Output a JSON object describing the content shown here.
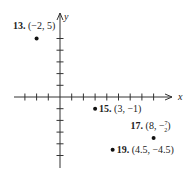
{
  "chart_data": {
    "type": "scatter",
    "title": "",
    "xlabel": "x",
    "ylabel": "y",
    "xlim": [
      -4,
      8
    ],
    "ylim": [
      -5,
      5
    ],
    "grid": false,
    "x_ticks": [
      -3,
      -2,
      -1,
      1,
      2,
      3,
      4,
      5,
      6,
      7,
      8
    ],
    "y_ticks": [
      -5,
      -4,
      -3,
      -2,
      -1,
      1,
      2,
      3,
      4,
      5
    ],
    "points": [
      {
        "id": "13",
        "number_label": "13.",
        "coord_label": "(−2, 5)",
        "x": -2,
        "y": 5,
        "label_pos": "above-left"
      },
      {
        "id": "15",
        "number_label": "15.",
        "coord_label": "(3, −1)",
        "x": 3,
        "y": -1,
        "label_pos": "right"
      },
      {
        "id": "17",
        "number_label": "17.",
        "coord_label": "(8, −½)",
        "coord_label_main": "(8, −",
        "frac_num": "7",
        "frac_den": "2",
        "coord_label_close": ")",
        "x": 8,
        "y": -3.5,
        "label_pos": "above"
      },
      {
        "id": "19",
        "number_label": "19.",
        "coord_label": "(4.5, −4.5)",
        "x": 4.5,
        "y": -4.5,
        "label_pos": "right"
      }
    ]
  }
}
